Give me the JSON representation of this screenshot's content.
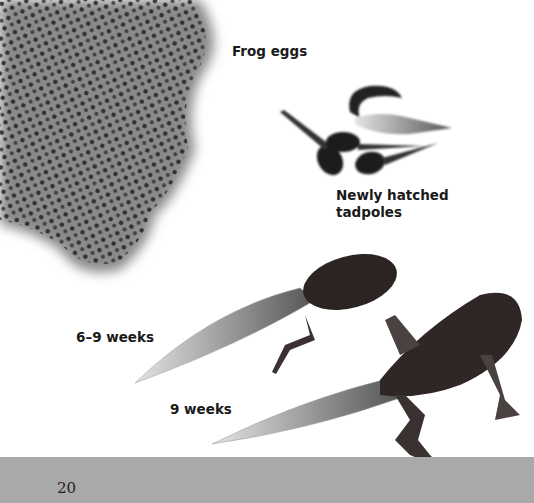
{
  "labels": {
    "eggs": "Frog eggs",
    "hatched_line1": "Newly hatched",
    "hatched_line2": "tadpoles",
    "stage_6_9": "6–9 weeks",
    "stage_9": "9 weeks"
  },
  "footer": {
    "page_number": "20",
    "color": "#a9a9a9"
  }
}
